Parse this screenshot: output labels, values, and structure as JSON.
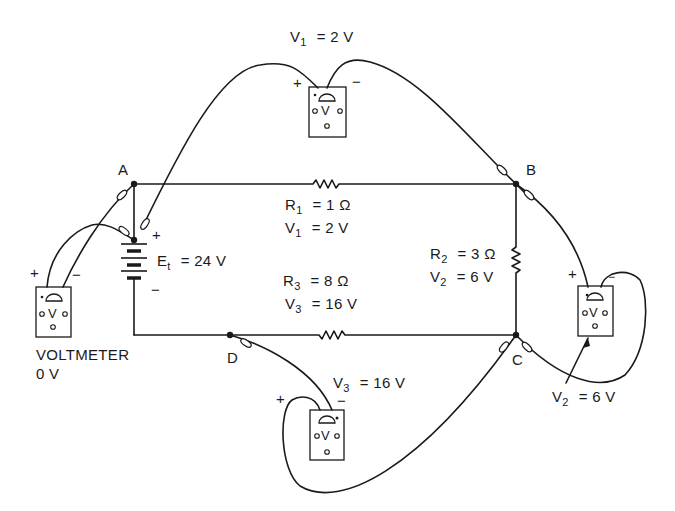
{
  "diagram": {
    "type": "series circuit with voltmeters",
    "nodes": [
      "A",
      "B",
      "C",
      "D"
    ],
    "source": {
      "name": "E",
      "subscript": "t",
      "value": "= 24 V",
      "plus": "+",
      "minus": "−"
    },
    "resistors": [
      {
        "name": "R",
        "sub": "1",
        "value": "= 1 Ω",
        "vname": "V",
        "vsub": "1",
        "vvalue": "= 2 V"
      },
      {
        "name": "R",
        "sub": "2",
        "value": "= 3 Ω",
        "vname": "V",
        "vsub": "2",
        "vvalue": "= 6 V"
      },
      {
        "name": "R",
        "sub": "3",
        "value": "= 8 Ω",
        "vname": "V",
        "vsub": "3",
        "vvalue": "= 16 V"
      }
    ],
    "meters": {
      "top": {
        "name": "V",
        "sub": "1",
        "value": "= 2 V",
        "plus": "+",
        "minus": "−",
        "face": "V"
      },
      "right": {
        "name": "V",
        "sub": "2",
        "value": "= 6 V",
        "plus": "+",
        "minus": "−",
        "face": "V"
      },
      "bottom": {
        "name": "V",
        "sub": "3",
        "value": "= 16 V",
        "plus": "+",
        "minus": "−",
        "face": "V"
      },
      "left": {
        "caption": "VOLTMETER",
        "reading": "0 V",
        "plus": "+",
        "minus": "−",
        "face": "V"
      }
    }
  }
}
